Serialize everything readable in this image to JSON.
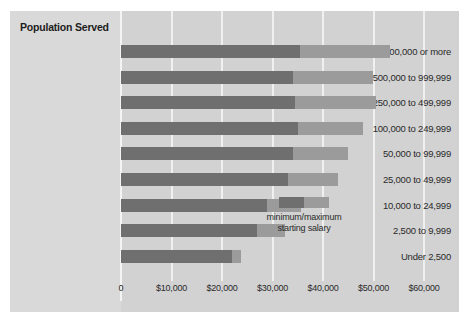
{
  "chart_data": {
    "type": "bar",
    "orientation": "horizontal",
    "subtype": "range-bar-stacked",
    "title": "Population Served",
    "xlabel": "",
    "ylabel": "Population Served",
    "categories": [
      "1,000,000 or more",
      "500,000 to 999,999",
      "250,000 to 499,999",
      "100,000 to 249,999",
      "50,000 to 99,999",
      "25,000 to 49,999",
      "10,000 to 24,999",
      "2,500 to 9,999",
      "Under 2,500"
    ],
    "series": [
      {
        "name": "minimum starting salary",
        "color": "#6f6f6f",
        "values": [
          35400,
          34000,
          34500,
          35000,
          34000,
          33000,
          29000,
          27000,
          22000
        ]
      },
      {
        "name": "maximum starting salary",
        "color": "#9b9b9b",
        "values": [
          53300,
          49900,
          50500,
          47900,
          45000,
          43000,
          35600,
          32500,
          23800
        ]
      }
    ],
    "xlim": [
      0,
      63000
    ],
    "xticks": [
      0,
      10000,
      20000,
      30000,
      40000,
      50000,
      60000
    ],
    "xtick_labels": [
      "0",
      "$10,000",
      "$20,000",
      "$30,000",
      "$40,000",
      "$50,000",
      "$60,000"
    ],
    "grid": true,
    "grid_axis": "x",
    "legend": {
      "position": "inside-right",
      "line1": "minimum/maximum",
      "line2": "starting salary"
    }
  },
  "colors": {
    "background": "#d4d4d4",
    "label_panel": "#d9d9d9",
    "plot_panel": "#d2d2d2",
    "bar_min": "#6f6f6f",
    "bar_max": "#9b9b9b",
    "gridline": "#f0f0f0",
    "text": "#2a2a2a",
    "title_text": "#1d1d1d"
  }
}
